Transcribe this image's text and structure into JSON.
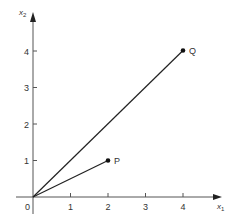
{
  "diagram": {
    "type": "vector-plot",
    "axes": {
      "x": {
        "label": "x",
        "subscript": "1",
        "ticks": [
          "0",
          "1",
          "2",
          "3",
          "4"
        ]
      },
      "y": {
        "label": "x",
        "subscript": "2",
        "ticks": [
          "1",
          "2",
          "3",
          "4"
        ]
      }
    },
    "vectors": [
      {
        "name": "P",
        "from": [
          0,
          0
        ],
        "to": [
          2,
          1
        ]
      },
      {
        "name": "Q",
        "from": [
          0,
          0
        ],
        "to": [
          4,
          4
        ]
      }
    ],
    "colors": {
      "line": "#222222",
      "axis": "#555555",
      "text": "#333333"
    }
  }
}
